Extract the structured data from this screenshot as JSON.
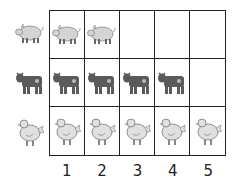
{
  "chart_data": {
    "type": "pictograph",
    "title": "",
    "categories": [
      "pig",
      "cow",
      "chicken"
    ],
    "values": [
      2,
      4,
      5
    ],
    "x_ticks": [
      "1",
      "2",
      "3",
      "4",
      "5"
    ],
    "xlabel": "",
    "ylabel": "",
    "xlim": [
      0,
      5
    ],
    "grid": true,
    "legend_icons_left": true
  },
  "rows": [
    {
      "animal": "pig",
      "icon": "pig-icon",
      "count": 2
    },
    {
      "animal": "cow",
      "icon": "cow-icon",
      "count": 4
    },
    {
      "animal": "chicken",
      "icon": "chicken-icon",
      "count": 5
    }
  ],
  "x_labels": [
    "1",
    "2",
    "3",
    "4",
    "5"
  ],
  "colors": {
    "pig": "#d4d4d4",
    "cow": "#5a5a5a",
    "chicken": "#e0e0e0",
    "grid": "#222222"
  }
}
